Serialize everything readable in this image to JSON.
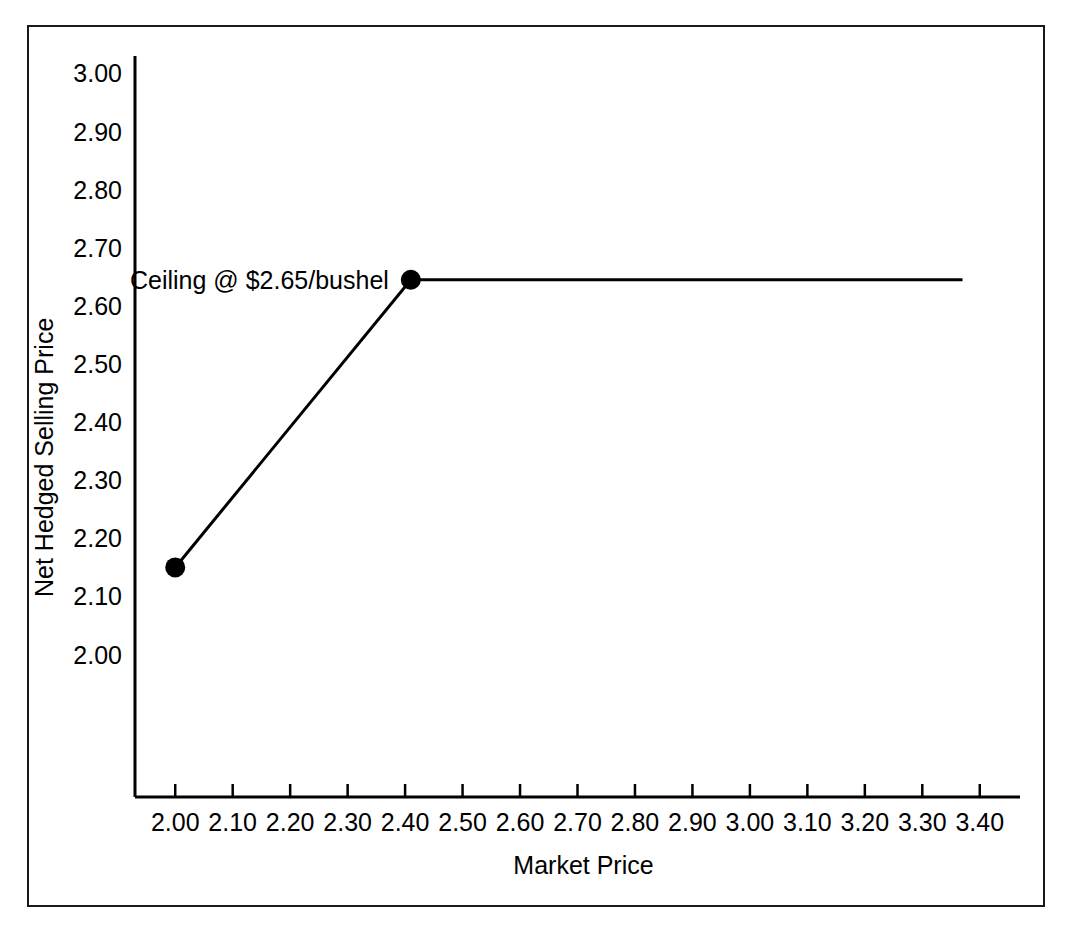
{
  "chart_data": {
    "type": "line",
    "title": "",
    "xlabel": "Market Price",
    "ylabel": "Net Hedged Selling Price",
    "xlim": [
      1.93,
      3.47
    ],
    "ylim": [
      1.755,
      3.03
    ],
    "grid": false,
    "legend": false,
    "x_ticks": [
      "2.00",
      "2.10",
      "2.20",
      "2.30",
      "2.40",
      "2.50",
      "2.60",
      "2.70",
      "2.80",
      "2.90",
      "3.00",
      "3.10",
      "3.20",
      "3.30",
      "3.40"
    ],
    "x_tick_values": [
      2.0,
      2.1,
      2.2,
      2.3,
      2.4,
      2.5,
      2.6,
      2.7,
      2.8,
      2.9,
      3.0,
      3.1,
      3.2,
      3.3,
      3.4
    ],
    "y_ticks": [
      "2.00",
      "2.10",
      "2.20",
      "2.30",
      "2.40",
      "2.50",
      "2.60",
      "2.70",
      "2.80",
      "2.90",
      "3.00"
    ],
    "y_tick_values": [
      2.0,
      2.1,
      2.2,
      2.3,
      2.4,
      2.5,
      2.6,
      2.7,
      2.8,
      2.9,
      3.0
    ],
    "series": [
      {
        "name": "Net Hedged Selling Price",
        "x": [
          2.0,
          2.41,
          3.37
        ],
        "values": [
          2.15,
          2.645,
          2.645
        ],
        "color": "#000000",
        "line_width": 3,
        "markers_at": [
          {
            "x": 2.0,
            "y": 2.15
          },
          {
            "x": 2.41,
            "y": 2.645
          }
        ]
      }
    ],
    "annotations": [
      {
        "text": "Ceiling @ $2.65/bushel",
        "x": 2.41,
        "y": 2.645,
        "anchor": "right-of-point-offset"
      }
    ]
  },
  "annotation": {
    "ceiling_label": "Ceiling @ $2.65/bushel"
  },
  "axes": {
    "x_title": "Market Price",
    "y_title": "Net Hedged Selling Price"
  },
  "colors": {
    "line": "#000000",
    "axis": "#000000",
    "frame": "#1a1a1a",
    "background": "#ffffff"
  }
}
